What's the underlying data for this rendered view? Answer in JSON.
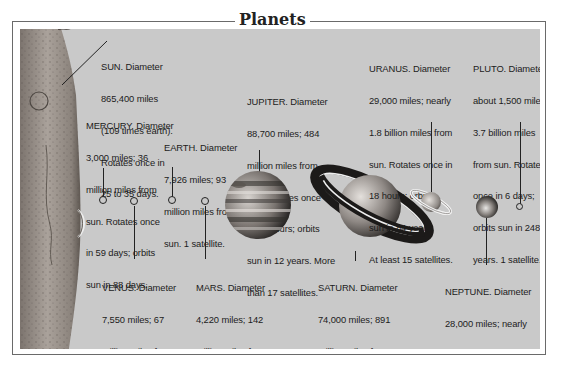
{
  "title": "Planets",
  "colors": {
    "panel_bg": "#c9c9c9",
    "frame": "#6a6a6a",
    "text": "#1c1c1c",
    "sun_surface": "#a09890"
  },
  "icons": {
    "sun": "sun-surface-illustration",
    "mercury": "small-circle-marker",
    "venus": "small-circle-marker",
    "earth": "small-circle-marker",
    "mars": "small-circle-marker",
    "jupiter": "banded-planet-illustration",
    "saturn": "ringed-planet-illustration",
    "uranus": "ringed-planet-illustration",
    "neptune": "shaded-sphere-illustration",
    "pluto": "small-circle-marker"
  },
  "planets": {
    "sun": {
      "name": "SUN",
      "lines": [
        "SUN. Diameter",
        "865,400 miles",
        "(109 times earth).",
        "Rotates once in",
        "25 to 35 days."
      ]
    },
    "mercury": {
      "name": "MERCURY",
      "lines": [
        "MERCURY. Diameter",
        "3,000 miles; 36",
        "million miles from",
        "sun. Rotates once",
        "in 59 days; orbits",
        "sun in 88 days."
      ]
    },
    "venus": {
      "name": "VENUS",
      "lines": [
        "VENUS. Diameter",
        "7,550 miles; 67",
        "million miles from",
        "sun. Rotates once",
        "in 243 days; orbits",
        "sun in 225 days."
      ]
    },
    "earth": {
      "name": "EARTH",
      "lines": [
        "EARTH. Diameter",
        "7,926 miles; 93",
        "million miles from",
        "sun. 1 satellite."
      ]
    },
    "mars": {
      "name": "MARS",
      "lines": [
        "MARS. Diameter",
        "4,220 miles; 142",
        "million miles from",
        "sun. Rotates once",
        "in 25 hours; orbits",
        "sun in 687 days.",
        "2 satellites."
      ]
    },
    "jupiter": {
      "name": "JUPITER",
      "lines": [
        "JUPITER. Diameter",
        "88,700 miles; 484",
        "million miles from",
        "sun. Rotates once",
        "in 10 hours; orbits",
        "sun in 12 years. More",
        "than 17 satellites."
      ]
    },
    "saturn": {
      "name": "SATURN",
      "lines": [
        "SATURN. Diameter",
        "74,000 miles; 891",
        "million miles from",
        "sun. Rotates once",
        "in 11 hours; orbits",
        "sun in 29 years.",
        "At last 22 satellites."
      ]
    },
    "uranus": {
      "name": "URANUS",
      "lines": [
        "URANUS. Diameter",
        "29,000 miles; nearly",
        "1.8 billion miles from",
        "sun. Rotates once in",
        "18 hours; orbits",
        "sun in 84 years.",
        "At least 15 satellites."
      ]
    },
    "neptune": {
      "name": "NEPTUNE",
      "lines": [
        "NEPTUNE. Diameter",
        "28,000 miles; nearly",
        "2.8 billion miles from",
        "sun. Rotates once",
        "in about 18 hours;",
        "orbits sun in 165",
        "years. 8 satellites."
      ]
    },
    "pluto": {
      "name": "PLUTO",
      "lines": [
        "PLUTO. Diameter",
        "about 1,500 miles;",
        "3.7 billion miles",
        "from sun. Rotates",
        "once in 6 days;",
        "orbits sun in 248",
        "years. 1 satellite."
      ]
    }
  }
}
